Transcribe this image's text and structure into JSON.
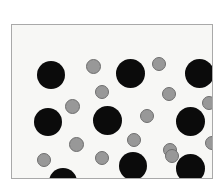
{
  "figure": {
    "title": "",
    "caption": "",
    "background_color": "#ffffff"
  },
  "frame": {
    "x": 11,
    "y": 24,
    "width": 202,
    "height": 155,
    "fill_color": "#f7f7f5",
    "border_color": "#a9a9a9",
    "border_width": 1
  },
  "chart_data": {
    "type": "scatter",
    "title": "",
    "subtitle": "",
    "xlabel": "",
    "ylabel": "",
    "xlim": [
      0,
      202
    ],
    "ylim": [
      0,
      155
    ],
    "grid": false,
    "legend_position": "none",
    "axis_ticks": false,
    "series": [
      {
        "name": "large-black-particles",
        "color": "#0b0b0b",
        "marker": "circle",
        "marker_diameter": 28,
        "count": 9,
        "points": [
          {
            "x": 39,
            "y": 50,
            "d": 28
          },
          {
            "x": 118,
            "y": 48,
            "d": 29
          },
          {
            "x": 187,
            "y": 48,
            "d": 29
          },
          {
            "x": 36,
            "y": 97,
            "d": 28
          },
          {
            "x": 95,
            "y": 95,
            "d": 29
          },
          {
            "x": 178,
            "y": 96,
            "d": 29
          },
          {
            "x": 51,
            "y": 157,
            "d": 28
          },
          {
            "x": 121,
            "y": 141,
            "d": 28
          },
          {
            "x": 178,
            "y": 143,
            "d": 29
          }
        ]
      },
      {
        "name": "small-gray-particles",
        "color": "#989898",
        "edge_color": "#6e6e6e",
        "marker": "circle",
        "marker_diameter": 14,
        "count": 17,
        "points": [
          {
            "x": 81,
            "y": 41,
            "d": 15
          },
          {
            "x": 147,
            "y": 39,
            "d": 14
          },
          {
            "x": 90,
            "y": 67,
            "d": 14
          },
          {
            "x": 60,
            "y": 81,
            "d": 15
          },
          {
            "x": 157,
            "y": 69,
            "d": 14
          },
          {
            "x": 135,
            "y": 91,
            "d": 14
          },
          {
            "x": 197,
            "y": 78,
            "d": 14
          },
          {
            "x": 64,
            "y": 119,
            "d": 15
          },
          {
            "x": 122,
            "y": 115,
            "d": 14
          },
          {
            "x": 158,
            "y": 125,
            "d": 14
          },
          {
            "x": 200,
            "y": 118,
            "d": 14
          },
          {
            "x": 32,
            "y": 135,
            "d": 14
          },
          {
            "x": 90,
            "y": 133,
            "d": 14
          },
          {
            "x": 146,
            "y": 162,
            "d": 14
          },
          {
            "x": 88,
            "y": 165,
            "d": 15
          },
          {
            "x": 204,
            "y": 166,
            "d": 14
          },
          {
            "x": 160,
            "y": 131,
            "d": 14
          }
        ]
      }
    ]
  }
}
